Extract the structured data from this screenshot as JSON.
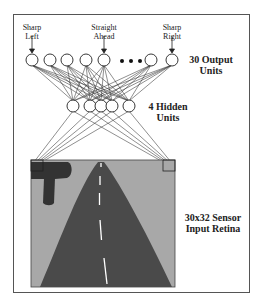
{
  "figure": {
    "output_labels": [
      {
        "line1": "Sharp",
        "line2": "Left"
      },
      {
        "line1": "Straight",
        "line2": "Ahead"
      },
      {
        "line1": "Sharp",
        "line2": "Right"
      }
    ],
    "output_layer_label": {
      "line1": "30 Output",
      "line2": "Units"
    },
    "hidden_layer_label": {
      "line1": "4 Hidden",
      "line2": "Units"
    },
    "input_layer_label": {
      "line1": "30x32 Sensor",
      "line2": "Input Retina"
    },
    "ellipsis": "• • •",
    "colors": {
      "frame": "#555555",
      "node_stroke": "#222222",
      "edge": "#333333",
      "retina_bg": "#a8a8a8",
      "road": "#4a4a4a",
      "tree": "#333333",
      "lane_marking": "#ffffff"
    }
  }
}
